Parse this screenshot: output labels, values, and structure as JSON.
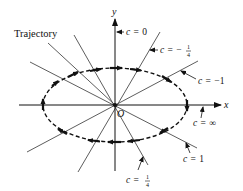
{
  "figure": {
    "origin_label": "O",
    "x_axis_label": "x",
    "y_axis_label": "y",
    "trajectory_label": "Trajectory",
    "direction": "clockwise",
    "colors": {
      "ink": "#111111",
      "lines": "#333333",
      "background": "#ffffff"
    }
  },
  "isoclines": [
    {
      "c_var": "c",
      "eq": "=",
      "value": "0",
      "is_fraction": false,
      "note": "y-axis"
    },
    {
      "c_var": "c",
      "eq": "=",
      "sign": "−",
      "numerator": "1",
      "denominator": "4",
      "is_fraction": true
    },
    {
      "c_var": "c",
      "eq": "=",
      "value": "−1",
      "is_fraction": false
    },
    {
      "c_var": "c",
      "eq": "=",
      "value": "∞",
      "is_fraction": false,
      "note": "x-axis"
    },
    {
      "c_var": "c",
      "eq": "=",
      "value": "1",
      "is_fraction": false
    },
    {
      "c_var": "c",
      "eq": "=",
      "sign": "",
      "numerator": "1",
      "denominator": "4",
      "is_fraction": true
    }
  ]
}
